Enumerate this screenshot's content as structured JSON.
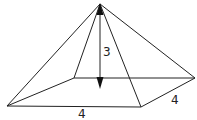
{
  "diagram": {
    "type": "square pyramid",
    "labels": {
      "height": "3",
      "base_front": "4",
      "base_side": "4"
    },
    "line_color": "#222222"
  }
}
